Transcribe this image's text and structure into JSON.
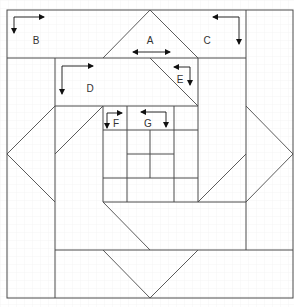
{
  "diagram": {
    "width": 294,
    "height": 307,
    "grid": {
      "minor_step": 8,
      "color": "#e6e6e6"
    },
    "stroke_color": "#4a4a4a",
    "arrow_color": "#111111",
    "frame": {
      "x": 7,
      "y": 10,
      "w": 286,
      "h": 288
    },
    "lines": [
      [
        7,
        58,
        246,
        58
      ],
      [
        246,
        10,
        246,
        250
      ],
      [
        55,
        58,
        55,
        298
      ],
      [
        198,
        58,
        198,
        202
      ],
      [
        55,
        106,
        198,
        106
      ],
      [
        103,
        106,
        103,
        202
      ],
      [
        103,
        202,
        246,
        202
      ],
      [
        55,
        250,
        293,
        250
      ],
      [
        103,
        130,
        198,
        130
      ],
      [
        103,
        178,
        198,
        178
      ],
      [
        127,
        106,
        127,
        202
      ],
      [
        174,
        106,
        174,
        202
      ],
      [
        127,
        154,
        174,
        154
      ],
      [
        150,
        130,
        150,
        178
      ]
    ],
    "diagonals": [
      [
        103,
        58,
        150,
        10
      ],
      [
        150,
        10,
        198,
        58
      ],
      [
        150,
        58,
        198,
        106
      ],
      [
        55,
        154,
        103,
        106
      ],
      [
        55,
        106,
        7,
        154
      ],
      [
        7,
        154,
        55,
        202
      ],
      [
        246,
        106,
        293,
        154
      ],
      [
        293,
        154,
        246,
        202
      ],
      [
        198,
        202,
        246,
        154
      ],
      [
        103,
        202,
        150,
        250
      ],
      [
        103,
        250,
        150,
        298
      ],
      [
        150,
        298,
        198,
        250
      ]
    ],
    "labels": [
      {
        "id": "A",
        "text": "A",
        "x": 150,
        "y": 41
      },
      {
        "id": "B",
        "text": "B",
        "x": 36,
        "y": 41
      },
      {
        "id": "C",
        "text": "C",
        "x": 207,
        "y": 41
      },
      {
        "id": "D",
        "text": "D",
        "x": 90,
        "y": 89
      },
      {
        "id": "E",
        "text": "E",
        "x": 180,
        "y": 80
      },
      {
        "id": "F",
        "text": "F",
        "x": 116,
        "y": 124
      },
      {
        "id": "G",
        "text": "G",
        "x": 148,
        "y": 124
      }
    ],
    "arrows": [
      {
        "for": "A",
        "type": "double-horizontal",
        "path": [
          [
            133,
            52
          ],
          [
            170,
            52
          ]
        ]
      },
      {
        "for": "B",
        "type": "elbow",
        "path": [
          [
            14,
            33
          ],
          [
            14,
            17
          ],
          [
            44,
            17
          ]
        ],
        "heads": [
          "start",
          "end"
        ]
      },
      {
        "for": "C",
        "type": "elbow",
        "path": [
          [
            213,
            17
          ],
          [
            239,
            17
          ],
          [
            239,
            44
          ]
        ],
        "heads": [
          "start",
          "end"
        ]
      },
      {
        "for": "D",
        "type": "elbow",
        "path": [
          [
            62,
            94
          ],
          [
            62,
            66
          ],
          [
            93,
            66
          ]
        ],
        "heads": [
          "start",
          "end"
        ]
      },
      {
        "for": "E",
        "type": "elbow",
        "path": [
          [
            174,
            67
          ],
          [
            190,
            67
          ],
          [
            190,
            85
          ]
        ],
        "heads": [
          "start",
          "end"
        ]
      },
      {
        "for": "F",
        "type": "elbow",
        "path": [
          [
            107,
            128
          ],
          [
            107,
            113
          ],
          [
            122,
            113
          ]
        ],
        "heads": [
          "start",
          "end"
        ]
      },
      {
        "for": "G",
        "type": "elbow",
        "path": [
          [
            141,
            112
          ],
          [
            166,
            112
          ],
          [
            166,
            127
          ]
        ],
        "heads": [
          "start",
          "end"
        ]
      }
    ]
  }
}
